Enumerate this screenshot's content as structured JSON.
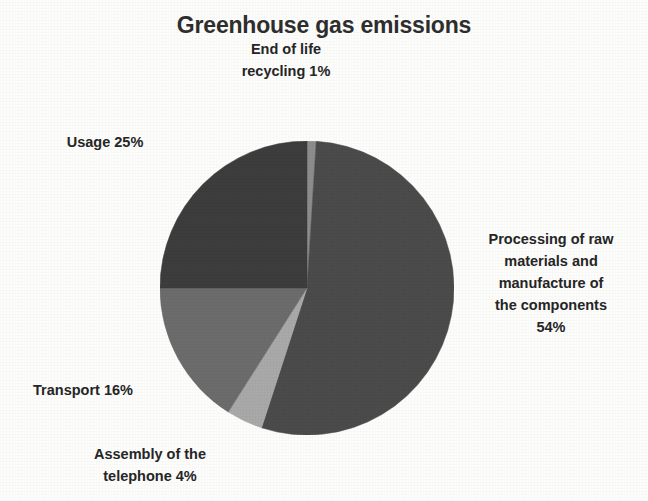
{
  "chart_data": {
    "type": "pie",
    "title": "Greenhouse gas emissions",
    "categories": [
      "End of life recycling",
      "Processing of raw materials and manufacture of the components",
      "Assembly of the telephone",
      "Transport",
      "Usage"
    ],
    "values": [
      1,
      54,
      4,
      16,
      25
    ],
    "unit": "%",
    "colors": [
      "#8d8d8d",
      "#4b4b4b",
      "#a9a9a9",
      "#6c6c6c",
      "#3d3d3d"
    ],
    "labels": [
      "End of life\nrecycling 1%",
      "Processing of raw\nmaterials and\nmanufacture of\nthe components\n54%",
      "Assembly of the\ntelephone 4%",
      "Transport 16%",
      "Usage 25%"
    ],
    "legend": "none",
    "grid": false,
    "start_angle_deg": -90,
    "direction": "clockwise",
    "background": "#fdfdfc",
    "text_color": "#262626"
  }
}
